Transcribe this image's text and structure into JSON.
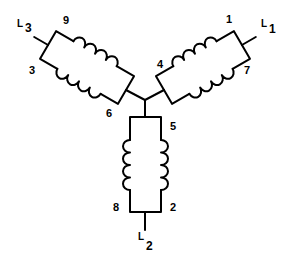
{
  "diagram": {
    "line_terminals": [
      {
        "id": "L1",
        "letter": "L",
        "sub": "1"
      },
      {
        "id": "L2",
        "letter": "L",
        "sub": "2"
      },
      {
        "id": "L3",
        "letter": "L",
        "sub": "3"
      }
    ],
    "lead_numbers": {
      "n1": "1",
      "n2": "2",
      "n3": "3",
      "n4": "4",
      "n5": "5",
      "n6": "6",
      "n7": "7",
      "n8": "8",
      "n9": "9"
    },
    "colors": {
      "line": "#000000",
      "background": "#ffffff"
    }
  }
}
